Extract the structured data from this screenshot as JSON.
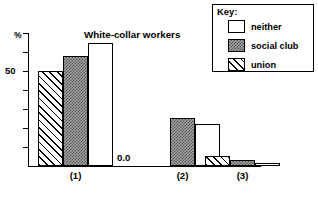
{
  "chart_data": {
    "type": "bar",
    "title": "White-collar workers",
    "xlabel": "",
    "ylabel": "%",
    "ylim": [
      0,
      70
    ],
    "grid": false,
    "legend_position": "top-right",
    "categories": [
      "(1)",
      "(2)",
      "(3)"
    ],
    "series": [
      {
        "name": "union",
        "values": [
          50,
          0,
          5
        ]
      },
      {
        "name": "social club",
        "values": [
          58,
          25,
          3
        ]
      },
      {
        "name": "neither",
        "values": [
          65,
          22,
          1.5
        ]
      }
    ],
    "bar_order_per_group": [
      "union",
      "social club",
      "neither"
    ],
    "annotations": [
      {
        "text": "0.0",
        "group": "(2)",
        "series": "union",
        "note": "zero-height bar labelled"
      }
    ],
    "y_ticks": [
      0,
      10,
      20,
      30,
      40,
      50,
      60,
      70
    ],
    "y_tick_labels_visible": [
      "50"
    ],
    "axis_unit_label": "%"
  },
  "legend": {
    "title": "Key:",
    "entries": [
      {
        "label": "neither",
        "pattern": "solid-white"
      },
      {
        "label": "social club",
        "pattern": "stipple-gray"
      },
      {
        "label": "union",
        "pattern": "diagonal-hatch"
      }
    ]
  },
  "axis": {
    "unit": "%",
    "tick_label_50": "50",
    "zero_annotation": "0.0"
  },
  "title": "White-collar workers",
  "group_labels": [
    "(1)",
    "(2)",
    "(3)"
  ],
  "colors": {
    "ink": "#000000",
    "paper": "#ffffff",
    "stipple": "#a9a9a9"
  }
}
